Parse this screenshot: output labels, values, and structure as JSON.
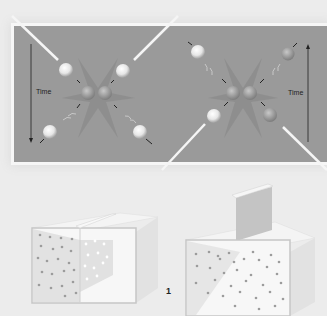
{
  "diagram": {
    "top_panel": {
      "left_scene": {
        "time_label": "Time",
        "time_arrow_direction": "down",
        "description": "Two particles approach from top-left and top-right along beam lines, collide at center, scatter toward bottom-left and bottom-right"
      },
      "right_scene": {
        "time_label": "Time",
        "time_arrow_direction": "up",
        "description": "Time-reversed collision: particles approach from bottom-left and bottom-right, collide at center, scatter toward top-left and top-right"
      },
      "background_color": "#9a9a9a"
    },
    "bottom_panel": {
      "left_box": {
        "description": "Box with partition inserted; gas particles confined to left half"
      },
      "right_box": {
        "description": "Partition lifted; gas particles spread throughout the box"
      }
    },
    "figure_number": "1"
  }
}
